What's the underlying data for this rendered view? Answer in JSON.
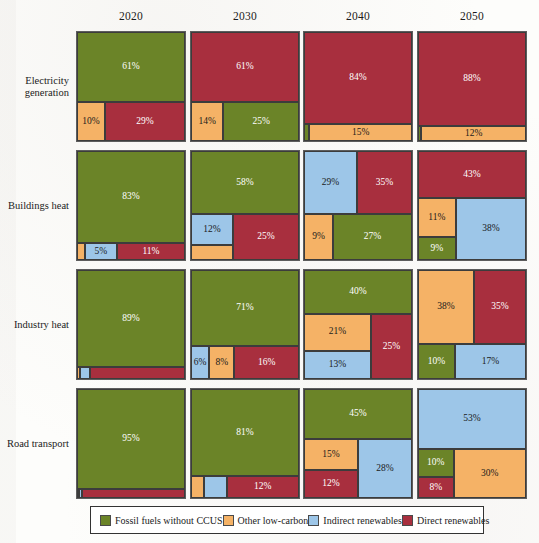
{
  "figure": {
    "columns": [
      "2020",
      "2030",
      "2040",
      "2050"
    ],
    "rows": [
      "Electricity generation",
      "Buildings heat",
      "Industry heat",
      "Road transport"
    ]
  },
  "legend": {
    "items": [
      {
        "key": "fossil",
        "label": "Fossil fuels without CCUS",
        "color": "#6b8428"
      },
      {
        "key": "lowcarbon",
        "label": "Other low-carbon",
        "color": "#f5b266"
      },
      {
        "key": "indirect",
        "label": "Indirect renewables",
        "color": "#9dc6e8"
      },
      {
        "key": "direct",
        "label": "Direct renewables",
        "color": "#a82f3e"
      }
    ]
  },
  "colors": {
    "fossil": "#6b8428",
    "lowcarbon": "#f5b266",
    "indirect": "#9dc6e8",
    "direct": "#a82f3e",
    "panel_border": "#5d5d5d",
    "cell_border": "#3c3c3c",
    "page_background": "#fdfdfb"
  },
  "chart_data": {
    "type": "bar",
    "title": "",
    "subtitle": "",
    "xlabel": "",
    "ylabel": "",
    "note": "Mosaic / treemap matrix of energy-supply shares by sector and year; each panel sums to 100%.",
    "categories": [
      "2020",
      "2030",
      "2040",
      "2050"
    ],
    "sectors": [
      "Electricity generation",
      "Buildings heat",
      "Industry heat",
      "Road transport"
    ],
    "series": [
      {
        "name": "Fossil fuels without CCUS",
        "key": "fossil",
        "values": {
          "Electricity generation": [
            61,
            25,
            1,
            0
          ],
          "Buildings heat": [
            83,
            58,
            27,
            9
          ],
          "Industry heat": [
            89,
            71,
            40,
            10
          ],
          "Road transport": [
            95,
            81,
            45,
            10
          ]
        }
      },
      {
        "name": "Other low-carbon",
        "key": "lowcarbon",
        "values": {
          "Electricity generation": [
            10,
            14,
            15,
            12
          ],
          "Buildings heat": [
            1,
            5,
            9,
            11
          ],
          "Industry heat": [
            1,
            8,
            21,
            38
          ],
          "Road transport": [
            1,
            3,
            15,
            30
          ]
        }
      },
      {
        "name": "Indirect renewables",
        "key": "indirect",
        "values": {
          "Electricity generation": [
            0,
            0,
            0,
            0
          ],
          "Buildings heat": [
            5,
            12,
            29,
            38
          ],
          "Industry heat": [
            2,
            6,
            13,
            17
          ],
          "Road transport": [
            1,
            4,
            28,
            53
          ]
        }
      },
      {
        "name": "Direct renewables",
        "key": "direct",
        "values": {
          "Electricity generation": [
            29,
            61,
            84,
            88
          ],
          "Buildings heat": [
            11,
            25,
            35,
            43
          ],
          "Industry heat": [
            8,
            16,
            25,
            35
          ],
          "Road transport": [
            3,
            12,
            12,
            8
          ]
        }
      }
    ],
    "panels": [
      {
        "row": "Electricity generation",
        "col": "2020",
        "cells": [
          {
            "key": "fossil",
            "label": "61%",
            "x": 0,
            "y": 0,
            "w": 100,
            "h": 64,
            "show": true,
            "light": true
          },
          {
            "key": "lowcarbon",
            "label": "10%",
            "x": 0,
            "y": 64,
            "w": 26,
            "h": 36,
            "show": true,
            "light": false
          },
          {
            "key": "direct",
            "label": "29%",
            "x": 26,
            "y": 64,
            "w": 74,
            "h": 36,
            "show": true,
            "light": true
          }
        ]
      },
      {
        "row": "Electricity generation",
        "col": "2030",
        "cells": [
          {
            "key": "direct",
            "label": "61%",
            "x": 0,
            "y": 0,
            "w": 100,
            "h": 64,
            "show": true,
            "light": true
          },
          {
            "key": "lowcarbon",
            "label": "14%",
            "x": 0,
            "y": 64,
            "w": 30,
            "h": 36,
            "show": true,
            "light": false
          },
          {
            "key": "fossil",
            "label": "25%",
            "x": 30,
            "y": 64,
            "w": 70,
            "h": 36,
            "show": true,
            "light": true
          }
        ]
      },
      {
        "row": "Electricity generation",
        "col": "2040",
        "cells": [
          {
            "key": "direct",
            "label": "84%",
            "x": 0,
            "y": 0,
            "w": 100,
            "h": 84,
            "show": true,
            "light": true
          },
          {
            "key": "fossil",
            "label": "1%",
            "x": 0,
            "y": 84,
            "w": 5,
            "h": 16,
            "show": false,
            "light": true
          },
          {
            "key": "lowcarbon",
            "label": "15%",
            "x": 5,
            "y": 84,
            "w": 95,
            "h": 16,
            "show": true,
            "light": false
          }
        ]
      },
      {
        "row": "Electricity generation",
        "col": "2050",
        "cells": [
          {
            "key": "direct",
            "label": "88%",
            "x": 0,
            "y": 0,
            "w": 100,
            "h": 86,
            "show": true,
            "light": true
          },
          {
            "key": "fossil",
            "label": "0%",
            "x": 0,
            "y": 86,
            "w": 3,
            "h": 14,
            "show": false,
            "light": true
          },
          {
            "key": "lowcarbon",
            "label": "12%",
            "x": 3,
            "y": 86,
            "w": 97,
            "h": 14,
            "show": true,
            "light": false
          }
        ]
      },
      {
        "row": "Buildings heat",
        "col": "2020",
        "cells": [
          {
            "key": "fossil",
            "label": "83%",
            "x": 0,
            "y": 0,
            "w": 100,
            "h": 84,
            "show": true,
            "light": true
          },
          {
            "key": "lowcarbon",
            "label": "1%",
            "x": 0,
            "y": 84,
            "w": 7,
            "h": 16,
            "show": false,
            "light": false
          },
          {
            "key": "indirect",
            "label": "5%",
            "x": 7,
            "y": 84,
            "w": 30,
            "h": 16,
            "show": true,
            "light": false
          },
          {
            "key": "direct",
            "label": "11%",
            "x": 37,
            "y": 84,
            "w": 63,
            "h": 16,
            "show": true,
            "light": true
          }
        ]
      },
      {
        "row": "Buildings heat",
        "col": "2030",
        "cells": [
          {
            "key": "fossil",
            "label": "58%",
            "x": 0,
            "y": 0,
            "w": 100,
            "h": 58,
            "show": true,
            "light": true
          },
          {
            "key": "indirect",
            "label": "12%",
            "x": 0,
            "y": 58,
            "w": 39,
            "h": 28,
            "show": true,
            "light": false
          },
          {
            "key": "lowcarbon",
            "label": "5%",
            "x": 0,
            "y": 86,
            "w": 39,
            "h": 14,
            "show": false,
            "light": false
          },
          {
            "key": "direct",
            "label": "25%",
            "x": 39,
            "y": 58,
            "w": 61,
            "h": 42,
            "show": true,
            "light": true
          }
        ]
      },
      {
        "row": "Buildings heat",
        "col": "2040",
        "cells": [
          {
            "key": "indirect",
            "label": "29%",
            "x": 0,
            "y": 0,
            "w": 49,
            "h": 58,
            "show": true,
            "light": false
          },
          {
            "key": "direct",
            "label": "35%",
            "x": 49,
            "y": 0,
            "w": 51,
            "h": 58,
            "show": true,
            "light": true
          },
          {
            "key": "lowcarbon",
            "label": "9%",
            "x": 0,
            "y": 58,
            "w": 27,
            "h": 42,
            "show": true,
            "light": false
          },
          {
            "key": "fossil",
            "label": "27%",
            "x": 27,
            "y": 58,
            "w": 73,
            "h": 42,
            "show": true,
            "light": true
          }
        ]
      },
      {
        "row": "Buildings heat",
        "col": "2050",
        "cells": [
          {
            "key": "direct",
            "label": "43%",
            "x": 0,
            "y": 0,
            "w": 100,
            "h": 43,
            "show": true,
            "light": true
          },
          {
            "key": "lowcarbon",
            "label": "11%",
            "x": 0,
            "y": 43,
            "w": 35,
            "h": 36,
            "show": true,
            "light": false
          },
          {
            "key": "fossil",
            "label": "9%",
            "x": 0,
            "y": 79,
            "w": 35,
            "h": 21,
            "show": true,
            "light": true
          },
          {
            "key": "indirect",
            "label": "38%",
            "x": 35,
            "y": 43,
            "w": 65,
            "h": 57,
            "show": true,
            "light": false
          }
        ]
      },
      {
        "row": "Industry heat",
        "col": "2020",
        "cells": [
          {
            "key": "fossil",
            "label": "89%",
            "x": 0,
            "y": 0,
            "w": 100,
            "h": 89,
            "show": true,
            "light": true
          },
          {
            "key": "lowcarbon",
            "label": "1%",
            "x": 0,
            "y": 89,
            "w": 3,
            "h": 11,
            "show": false,
            "light": false
          },
          {
            "key": "indirect",
            "label": "2%",
            "x": 3,
            "y": 89,
            "w": 9,
            "h": 11,
            "show": false,
            "light": false
          },
          {
            "key": "direct",
            "label": "8%",
            "x": 12,
            "y": 89,
            "w": 88,
            "h": 11,
            "show": false,
            "light": true
          }
        ]
      },
      {
        "row": "Industry heat",
        "col": "2030",
        "cells": [
          {
            "key": "fossil",
            "label": "71%",
            "x": 0,
            "y": 0,
            "w": 100,
            "h": 70,
            "show": true,
            "light": true
          },
          {
            "key": "indirect",
            "label": "6%",
            "x": 0,
            "y": 70,
            "w": 17,
            "h": 30,
            "show": true,
            "light": false
          },
          {
            "key": "lowcarbon",
            "label": "8%",
            "x": 17,
            "y": 70,
            "w": 23,
            "h": 30,
            "show": true,
            "light": false
          },
          {
            "key": "direct",
            "label": "16%",
            "x": 40,
            "y": 70,
            "w": 60,
            "h": 30,
            "show": true,
            "light": true
          }
        ]
      },
      {
        "row": "Industry heat",
        "col": "2040",
        "cells": [
          {
            "key": "fossil",
            "label": "40%",
            "x": 0,
            "y": 0,
            "w": 100,
            "h": 40,
            "show": true,
            "light": true
          },
          {
            "key": "lowcarbon",
            "label": "21%",
            "x": 0,
            "y": 40,
            "w": 62,
            "h": 34,
            "show": true,
            "light": false
          },
          {
            "key": "indirect",
            "label": "13%",
            "x": 0,
            "y": 74,
            "w": 62,
            "h": 26,
            "show": true,
            "light": false
          },
          {
            "key": "direct",
            "label": "25%",
            "x": 62,
            "y": 40,
            "w": 38,
            "h": 60,
            "show": true,
            "light": true
          }
        ]
      },
      {
        "row": "Industry heat",
        "col": "2050",
        "cells": [
          {
            "key": "lowcarbon",
            "label": "38%",
            "x": 0,
            "y": 0,
            "w": 52,
            "h": 68,
            "show": true,
            "light": false
          },
          {
            "key": "direct",
            "label": "35%",
            "x": 52,
            "y": 0,
            "w": 48,
            "h": 68,
            "show": true,
            "light": true
          },
          {
            "key": "fossil",
            "label": "10%",
            "x": 0,
            "y": 68,
            "w": 34,
            "h": 32,
            "show": true,
            "light": true
          },
          {
            "key": "indirect",
            "label": "17%",
            "x": 34,
            "y": 68,
            "w": 66,
            "h": 32,
            "show": true,
            "light": false
          }
        ]
      },
      {
        "row": "Road transport",
        "col": "2020",
        "cells": [
          {
            "key": "fossil",
            "label": "95%",
            "x": 0,
            "y": 0,
            "w": 100,
            "h": 92,
            "show": true,
            "light": true
          },
          {
            "key": "lowcarbon",
            "label": "1%",
            "x": 0,
            "y": 92,
            "w": 2,
            "h": 8,
            "show": false,
            "light": false
          },
          {
            "key": "indirect",
            "label": "1%",
            "x": 2,
            "y": 92,
            "w": 3,
            "h": 8,
            "show": false,
            "light": false
          },
          {
            "key": "direct",
            "label": "3%",
            "x": 5,
            "y": 92,
            "w": 95,
            "h": 8,
            "show": false,
            "light": true
          }
        ]
      },
      {
        "row": "Road transport",
        "col": "2030",
        "cells": [
          {
            "key": "fossil",
            "label": "81%",
            "x": 0,
            "y": 0,
            "w": 100,
            "h": 80,
            "show": true,
            "light": true
          },
          {
            "key": "lowcarbon",
            "label": "3%",
            "x": 0,
            "y": 80,
            "w": 12,
            "h": 20,
            "show": false,
            "light": false
          },
          {
            "key": "indirect",
            "label": "4%",
            "x": 12,
            "y": 80,
            "w": 21,
            "h": 20,
            "show": false,
            "light": false
          },
          {
            "key": "direct",
            "label": "12%",
            "x": 33,
            "y": 80,
            "w": 67,
            "h": 20,
            "show": true,
            "light": true
          }
        ]
      },
      {
        "row": "Road transport",
        "col": "2040",
        "cells": [
          {
            "key": "fossil",
            "label": "45%",
            "x": 0,
            "y": 0,
            "w": 100,
            "h": 46,
            "show": true,
            "light": true
          },
          {
            "key": "lowcarbon",
            "label": "15%",
            "x": 0,
            "y": 46,
            "w": 50,
            "h": 28,
            "show": true,
            "light": false
          },
          {
            "key": "direct",
            "label": "12%",
            "x": 0,
            "y": 74,
            "w": 50,
            "h": 26,
            "show": true,
            "light": true
          },
          {
            "key": "indirect",
            "label": "28%",
            "x": 50,
            "y": 46,
            "w": 50,
            "h": 54,
            "show": true,
            "light": false
          }
        ]
      },
      {
        "row": "Road transport",
        "col": "2050",
        "cells": [
          {
            "key": "indirect",
            "label": "53%",
            "x": 0,
            "y": 0,
            "w": 100,
            "h": 55,
            "show": true,
            "light": false
          },
          {
            "key": "fossil",
            "label": "10%",
            "x": 0,
            "y": 55,
            "w": 33,
            "h": 26,
            "show": true,
            "light": true
          },
          {
            "key": "direct",
            "label": "8%",
            "x": 0,
            "y": 81,
            "w": 33,
            "h": 19,
            "show": true,
            "light": true
          },
          {
            "key": "lowcarbon",
            "label": "30%",
            "x": 33,
            "y": 55,
            "w": 67,
            "h": 45,
            "show": true,
            "light": false
          }
        ]
      }
    ]
  }
}
